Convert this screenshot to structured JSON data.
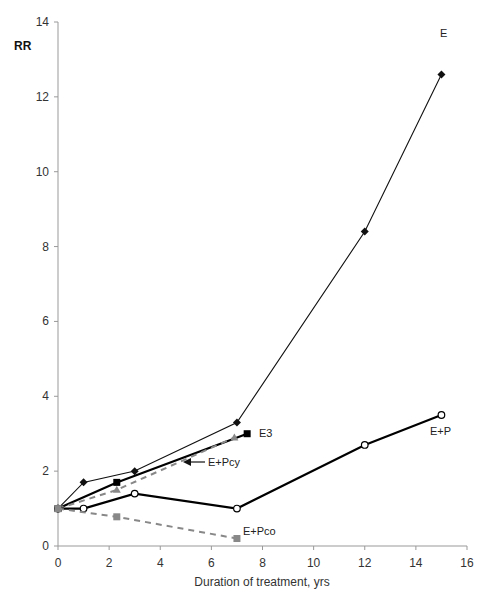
{
  "chart_data": {
    "type": "line",
    "title": "",
    "xlabel": "Duration of treatment, yrs",
    "ylabel": "RR",
    "xlim": [
      0,
      16
    ],
    "ylim": [
      0,
      14
    ],
    "x_ticks": [
      0,
      2,
      4,
      6,
      8,
      10,
      12,
      14,
      16
    ],
    "y_ticks": [
      0,
      2,
      4,
      6,
      8,
      10,
      12,
      14
    ],
    "grid": false,
    "legend": "inline labels",
    "series": [
      {
        "name": "E",
        "x": [
          0,
          1,
          3,
          7,
          12,
          15
        ],
        "y": [
          1.0,
          1.7,
          2.0,
          3.3,
          8.4,
          12.6
        ],
        "color": "#111111",
        "marker": "diamond",
        "line": "solid-thin",
        "label_pos": [
          440,
          37
        ]
      },
      {
        "name": "E3",
        "x": [
          0,
          2.3,
          7.4
        ],
        "y": [
          1.0,
          1.7,
          3.0
        ],
        "color": "#000000",
        "marker": "square",
        "line": "solid-thick",
        "label_pos": [
          259,
          437
        ]
      },
      {
        "name": "E+Pcy",
        "x": [
          0,
          2.3,
          6.9
        ],
        "y": [
          1.0,
          1.5,
          2.9
        ],
        "color": "#888888",
        "marker": "triangle",
        "line": "dashed",
        "label_pos": [
          208,
          466
        ],
        "arrow": {
          "from": [
            205,
            462
          ],
          "to": [
            183,
            462
          ]
        }
      },
      {
        "name": "E+P",
        "x": [
          0,
          1,
          3,
          7,
          12,
          15
        ],
        "y": [
          1.0,
          1.0,
          1.4,
          1.0,
          2.7,
          3.5
        ],
        "color": "#000000",
        "marker": "open-circle",
        "line": "solid-thick",
        "label_pos": [
          430,
          435
        ]
      },
      {
        "name": "E+Pco",
        "x": [
          0,
          2.3,
          7
        ],
        "y": [
          1.0,
          0.78,
          0.2
        ],
        "color": "#888888",
        "marker": "square",
        "line": "dashed",
        "label_pos": [
          243,
          535
        ]
      }
    ]
  }
}
